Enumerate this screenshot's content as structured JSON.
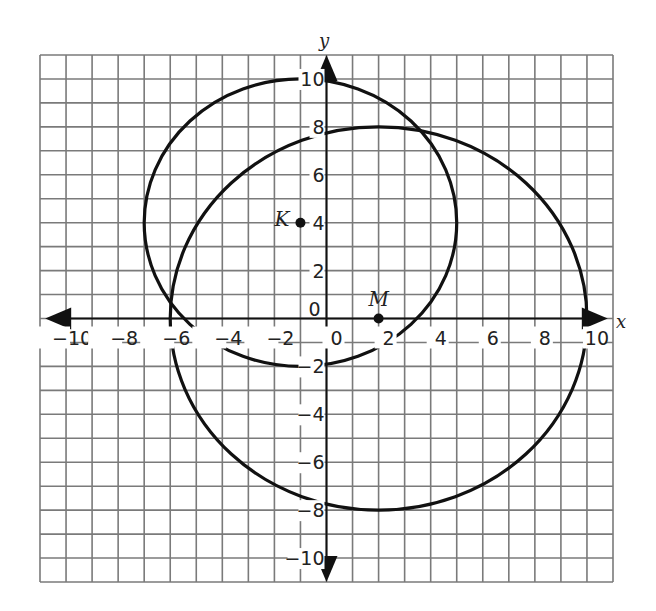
{
  "chart_data": {
    "type": "scatter",
    "title": "",
    "xlabel": "x",
    "ylabel": "y",
    "xlim": [
      -11,
      11
    ],
    "ylim": [
      -11,
      11
    ],
    "grid": true,
    "grid_step": 1,
    "x_ticks": [
      -10,
      -8,
      -6,
      -4,
      -2,
      0,
      2,
      4,
      6,
      8,
      10
    ],
    "y_ticks": [
      -10,
      -8,
      -6,
      -4,
      -2,
      0,
      2,
      4,
      6,
      8,
      10
    ],
    "x_tick_labels": [
      "−10",
      "−8",
      "−6",
      "−4",
      "−2",
      "0",
      "2",
      "4",
      "6",
      "8",
      "10"
    ],
    "y_tick_labels": [
      "−10",
      "−8",
      "−6",
      "−4",
      "−2",
      "0",
      "2",
      "4",
      "6",
      "8",
      "10"
    ],
    "points": [
      {
        "label": "K",
        "x": -1,
        "y": 4
      },
      {
        "label": "M",
        "x": 2,
        "y": 0
      }
    ],
    "circles": [
      {
        "name": "circle K",
        "center": [
          -1,
          4
        ],
        "radius": 6
      },
      {
        "name": "circle M",
        "center": [
          2,
          0
        ],
        "radius": 8
      }
    ],
    "legend": null
  },
  "labels": {
    "x_axis": "x",
    "y_axis": "y",
    "point_k": "K",
    "point_m": "M"
  }
}
